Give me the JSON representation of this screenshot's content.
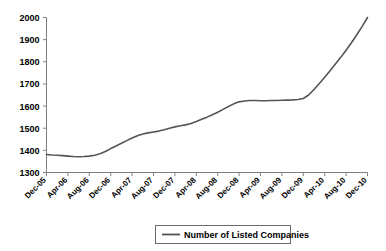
{
  "chart_data": {
    "type": "line",
    "title": "",
    "xlabel": "",
    "ylabel": "",
    "ylim": [
      1300,
      2000
    ],
    "ytick_values": [
      1300,
      1400,
      1500,
      1600,
      1700,
      1800,
      1900,
      2000
    ],
    "ytick_labels": [
      "1300",
      "1400",
      "1500",
      "1600",
      "1700",
      "1800",
      "1900",
      "2000"
    ],
    "grid": false,
    "legend_position": "bottom-center",
    "legend_entries": [
      "Number of Listed Companies"
    ],
    "line_color": "#555555",
    "categories": [
      "Dec-05",
      "Apr-06",
      "Aug-06",
      "Dec-06",
      "Apr-07",
      "Aug-07",
      "Dec-07",
      "Apr-08",
      "Aug-08",
      "Dec-08",
      "Apr-09",
      "Aug-09",
      "Dec-09",
      "Apr-10",
      "Aug-10",
      "Dec-10"
    ],
    "tick_categories": [
      "Dec-05",
      "Apr-06",
      "Aug-06",
      "Dec-06",
      "Apr-07",
      "Aug-07",
      "Dec-07",
      "Apr-08",
      "Aug-08",
      "Dec-08",
      "Apr-09",
      "Aug-09",
      "Dec-09",
      "Apr-10",
      "Aug-10",
      "Dec-10"
    ],
    "series": [
      {
        "name": "Number of Listed Companies",
        "x": [
          "Dec-05",
          "Jan-06",
          "Feb-06",
          "Mar-06",
          "Apr-06",
          "May-06",
          "Jun-06",
          "Jul-06",
          "Aug-06",
          "Sep-06",
          "Oct-06",
          "Nov-06",
          "Dec-06",
          "Jan-07",
          "Feb-07",
          "Mar-07",
          "Apr-07",
          "May-07",
          "Jun-07",
          "Jul-07",
          "Aug-07",
          "Sep-07",
          "Oct-07",
          "Nov-07",
          "Dec-07",
          "Jan-08",
          "Feb-08",
          "Mar-08",
          "Apr-08",
          "May-08",
          "Jun-08",
          "Jul-08",
          "Aug-08",
          "Sep-08",
          "Oct-08",
          "Nov-08",
          "Dec-08",
          "Jan-09",
          "Feb-09",
          "Mar-09",
          "Apr-09",
          "May-09",
          "Jun-09",
          "Jul-09",
          "Aug-09",
          "Sep-09",
          "Oct-09",
          "Nov-09",
          "Dec-09",
          "Jan-10",
          "Feb-10",
          "Mar-10",
          "Apr-10",
          "May-10",
          "Jun-10",
          "Jul-10",
          "Aug-10",
          "Sep-10",
          "Oct-10",
          "Nov-10",
          "Dec-10"
        ],
        "values": [
          1381,
          1379,
          1378,
          1376,
          1374,
          1372,
          1371,
          1372,
          1374,
          1378,
          1385,
          1395,
          1408,
          1420,
          1432,
          1444,
          1456,
          1466,
          1474,
          1479,
          1483,
          1487,
          1493,
          1500,
          1506,
          1511,
          1515,
          1521,
          1530,
          1540,
          1550,
          1561,
          1572,
          1585,
          1598,
          1610,
          1619,
          1623,
          1625,
          1625,
          1624,
          1624,
          1625,
          1625,
          1626,
          1627,
          1628,
          1630,
          1634,
          1650,
          1675,
          1702,
          1730,
          1760,
          1790,
          1820,
          1852,
          1886,
          1922,
          1960,
          2000
        ]
      }
    ]
  }
}
